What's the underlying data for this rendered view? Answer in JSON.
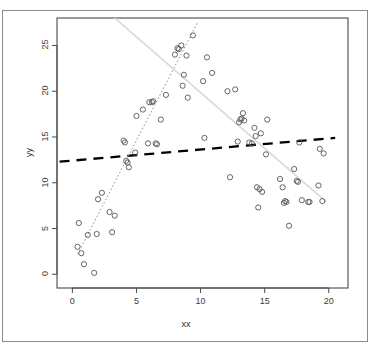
{
  "chart_data": {
    "type": "scatter",
    "title": "",
    "subtitle": "",
    "xlabel": "xx",
    "ylabel": "yy",
    "xlim": [
      -1.2,
      21.5
    ],
    "ylim": [
      -1.5,
      28.0
    ],
    "xticks": [
      0,
      5,
      10,
      15,
      20
    ],
    "yticks": [
      0,
      5,
      10,
      15,
      20,
      25
    ],
    "xtick_labels": [
      "0",
      "5",
      "10",
      "15",
      "20"
    ],
    "ytick_labels": [
      "0",
      "5",
      "10",
      "15",
      "20",
      "25"
    ],
    "grid": false,
    "legend": null,
    "point_marker": "open-circle",
    "point_color": "#555555",
    "points": [
      [
        0.4,
        3.0
      ],
      [
        0.5,
        5.6
      ],
      [
        0.7,
        2.3
      ],
      [
        0.9,
        1.1
      ],
      [
        1.2,
        4.3
      ],
      [
        1.7,
        0.15
      ],
      [
        1.9,
        4.4
      ],
      [
        2.0,
        8.2
      ],
      [
        2.3,
        8.9
      ],
      [
        2.9,
        6.8
      ],
      [
        3.1,
        4.6
      ],
      [
        3.3,
        6.4
      ],
      [
        4.0,
        14.6
      ],
      [
        4.1,
        14.4
      ],
      [
        4.2,
        12.4
      ],
      [
        4.3,
        12.2
      ],
      [
        4.4,
        11.7
      ],
      [
        4.9,
        13.3
      ],
      [
        5.0,
        17.3
      ],
      [
        5.5,
        18.0
      ],
      [
        5.9,
        14.3
      ],
      [
        6.0,
        18.8
      ],
      [
        6.2,
        18.8
      ],
      [
        6.3,
        18.9
      ],
      [
        6.5,
        14.3
      ],
      [
        6.6,
        14.2
      ],
      [
        6.9,
        16.9
      ],
      [
        7.3,
        19.6
      ],
      [
        8.0,
        24.0
      ],
      [
        8.2,
        24.7
      ],
      [
        8.3,
        24.6
      ],
      [
        8.5,
        25.0
      ],
      [
        8.6,
        20.6
      ],
      [
        8.7,
        21.8
      ],
      [
        8.9,
        23.9
      ],
      [
        9.0,
        19.3
      ],
      [
        9.4,
        26.1
      ],
      [
        10.2,
        21.1
      ],
      [
        10.3,
        14.9
      ],
      [
        10.5,
        23.7
      ],
      [
        10.9,
        22.0
      ],
      [
        12.1,
        20.0
      ],
      [
        12.3,
        10.6
      ],
      [
        12.7,
        20.2
      ],
      [
        12.9,
        14.5
      ],
      [
        13.0,
        16.6
      ],
      [
        13.1,
        16.9
      ],
      [
        13.2,
        17.0
      ],
      [
        13.3,
        17.6
      ],
      [
        13.4,
        16.8
      ],
      [
        13.8,
        14.4
      ],
      [
        14.0,
        14.3
      ],
      [
        14.2,
        16.0
      ],
      [
        14.3,
        15.1
      ],
      [
        14.4,
        9.5
      ],
      [
        14.5,
        7.3
      ],
      [
        14.6,
        9.3
      ],
      [
        14.7,
        15.4
      ],
      [
        14.8,
        9.0
      ],
      [
        15.1,
        13.1
      ],
      [
        15.2,
        16.9
      ],
      [
        16.2,
        10.4
      ],
      [
        16.4,
        9.5
      ],
      [
        16.5,
        7.8
      ],
      [
        16.6,
        8.0
      ],
      [
        16.7,
        7.9
      ],
      [
        16.9,
        5.3
      ],
      [
        17.3,
        11.5
      ],
      [
        17.5,
        10.2
      ],
      [
        17.6,
        10.1
      ],
      [
        17.7,
        14.4
      ],
      [
        17.9,
        8.1
      ],
      [
        18.4,
        7.9
      ],
      [
        18.5,
        7.9
      ],
      [
        19.2,
        9.7
      ],
      [
        19.3,
        13.7
      ],
      [
        19.5,
        8.0
      ],
      [
        19.6,
        13.2
      ]
    ],
    "lines": [
      {
        "name": "overall-regression-line",
        "style": "dashed-thick",
        "color": "#000000",
        "x0": -1.0,
        "y0": 12.3,
        "x1": 20.5,
        "y1": 14.9
      },
      {
        "name": "subgroup-dotted-line",
        "style": "dotted",
        "color": "#909090",
        "x0": 0.4,
        "y0": 2.2,
        "x1": 9.8,
        "y1": 27.6
      },
      {
        "name": "light-gray-trend-line",
        "style": "solid-light",
        "color": "#d8d8d8",
        "x0": 3.3,
        "y0": 28.0,
        "x1": 19.8,
        "y1": 7.9
      }
    ]
  },
  "figure": {
    "xlabel": "xx",
    "ylabel": "yy"
  }
}
